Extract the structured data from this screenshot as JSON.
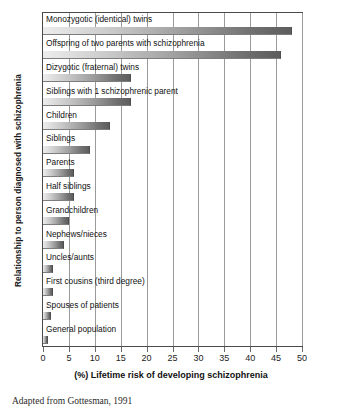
{
  "chart_data": {
    "type": "bar",
    "orientation": "horizontal",
    "title": "",
    "xlabel": "(%) Lifetime risk of developing schizophrenia",
    "ylabel": "Relationship to person diagnosed with schizophrenia",
    "xlim": [
      0,
      50
    ],
    "xticks": [
      0,
      5,
      10,
      15,
      20,
      25,
      30,
      35,
      40,
      45,
      50
    ],
    "xtick_labels": [
      "0",
      "5",
      "10",
      "15",
      "20",
      "25",
      "30",
      "35",
      "40",
      "45",
      "50"
    ],
    "grid": true,
    "legend": null,
    "categories": [
      "Monozygotic (identical) twins",
      "Offspring of two parents with schizophrenia",
      "Dizygotic (fraternal) twins",
      "Siblings with 1 schizophrenic parent",
      "Children",
      "Siblings",
      "Parents",
      "Half siblings",
      "Grandchildren",
      "Nephews/nieces",
      "Uncles/aunts",
      "First cousins (third degree)",
      "Spouses of patients",
      "General population"
    ],
    "values": [
      48,
      46,
      17,
      17,
      13,
      9,
      6,
      6,
      5,
      4,
      2,
      2,
      1.5,
      1
    ],
    "bar_color_start": "#ededed",
    "bar_color_end": "#5d5d5d"
  },
  "source_note": "Adapted from Gottesman, 1991"
}
